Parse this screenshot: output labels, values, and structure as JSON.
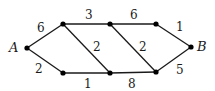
{
  "graph": {
    "nodes": [
      {
        "id": "A",
        "label": "A",
        "x": 27,
        "y": 48,
        "lx": 9,
        "ly": 52
      },
      {
        "id": "N1",
        "label": "",
        "x": 63,
        "y": 24
      },
      {
        "id": "N2",
        "label": "",
        "x": 110,
        "y": 24
      },
      {
        "id": "N3",
        "label": "",
        "x": 156,
        "y": 24
      },
      {
        "id": "N4",
        "label": "",
        "x": 63,
        "y": 73
      },
      {
        "id": "N5",
        "label": "",
        "x": 110,
        "y": 73
      },
      {
        "id": "N6",
        "label": "",
        "x": 156,
        "y": 72
      },
      {
        "id": "B",
        "label": "B",
        "x": 191,
        "y": 47,
        "lx": 197,
        "ly": 51
      }
    ],
    "edges": [
      {
        "from": "A",
        "to": "N1",
        "weight": "6",
        "lx": 37,
        "ly": 32
      },
      {
        "from": "A",
        "to": "N4",
        "weight": "2",
        "lx": 35,
        "ly": 73
      },
      {
        "from": "N1",
        "to": "N2",
        "weight": "3",
        "lx": 85,
        "ly": 19
      },
      {
        "from": "N1",
        "to": "N5",
        "weight": "2",
        "lx": 93,
        "ly": 51
      },
      {
        "from": "N4",
        "to": "N5",
        "weight": "1",
        "lx": 84,
        "ly": 88
      },
      {
        "from": "N2",
        "to": "N3",
        "weight": "6",
        "lx": 130,
        "ly": 19
      },
      {
        "from": "N2",
        "to": "N6",
        "weight": "2",
        "lx": 139,
        "ly": 51
      },
      {
        "from": "N5",
        "to": "N6",
        "weight": "8",
        "lx": 128,
        "ly": 88
      },
      {
        "from": "N3",
        "to": "B",
        "weight": "1",
        "lx": 176,
        "ly": 31
      },
      {
        "from": "N6",
        "to": "B",
        "weight": "5",
        "lx": 176,
        "ly": 74
      }
    ]
  }
}
